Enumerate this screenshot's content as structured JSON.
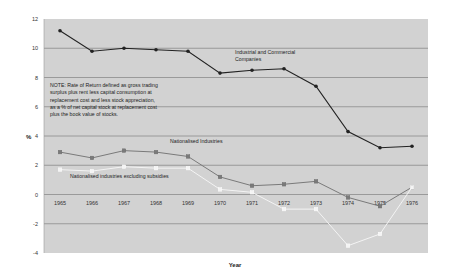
{
  "chart_data": {
    "type": "line",
    "title": "",
    "xlabel": "Year",
    "ylabel": "%",
    "ylim": [
      -4,
      12
    ],
    "yticks": [
      -4,
      -2,
      0,
      2,
      4,
      6,
      8,
      10,
      12
    ],
    "grid": true,
    "legend": "inline annotations",
    "categories": [
      "1965",
      "1966",
      "1967",
      "1968",
      "1969",
      "1970",
      "1971",
      "1972",
      "1973",
      "1974",
      "1975",
      "1976"
    ],
    "series": [
      {
        "name": "Industrial and Commercial Companies",
        "color": "#222222",
        "marker": "circle",
        "values": [
          11.2,
          9.8,
          10.0,
          9.9,
          9.8,
          8.3,
          8.5,
          8.6,
          7.4,
          4.3,
          3.2,
          3.3
        ]
      },
      {
        "name": "Nationalised Industries",
        "color": "#7a7a7a",
        "marker": "square",
        "values": [
          2.9,
          2.5,
          3.0,
          2.9,
          2.6,
          1.2,
          0.6,
          0.7,
          0.9,
          -0.2,
          -0.8,
          0.5
        ]
      },
      {
        "name": "Nationalised industries excluding subsidies",
        "color": "#f4f4f4",
        "marker": "square",
        "values": [
          1.7,
          1.6,
          1.9,
          1.8,
          1.8,
          0.35,
          0.15,
          -1.0,
          -1.0,
          -3.5,
          -2.7,
          0.5
        ]
      }
    ],
    "annotations": [
      {
        "text": "Industrial and Commercial",
        "x": 235,
        "y": 54
      },
      {
        "text": "Companies",
        "x": 235,
        "y": 61
      },
      {
        "text": "Nationalised Industries",
        "x": 170,
        "y": 143
      },
      {
        "text": "Nationalised industries excluding subsidies",
        "x": 70,
        "y": 178
      }
    ],
    "note": [
      "NOTE:  Rate of Return defined as gross trading",
      "surplus plus rent less capital consumption at",
      "replacement cost  and less stock appreciation,",
      "as a % of net capital stock at replacement cost",
      "plus the book value of  stocks."
    ]
  },
  "colors": {
    "plot_background": "#d2d2d2",
    "gridline": "#8c8c8c"
  }
}
